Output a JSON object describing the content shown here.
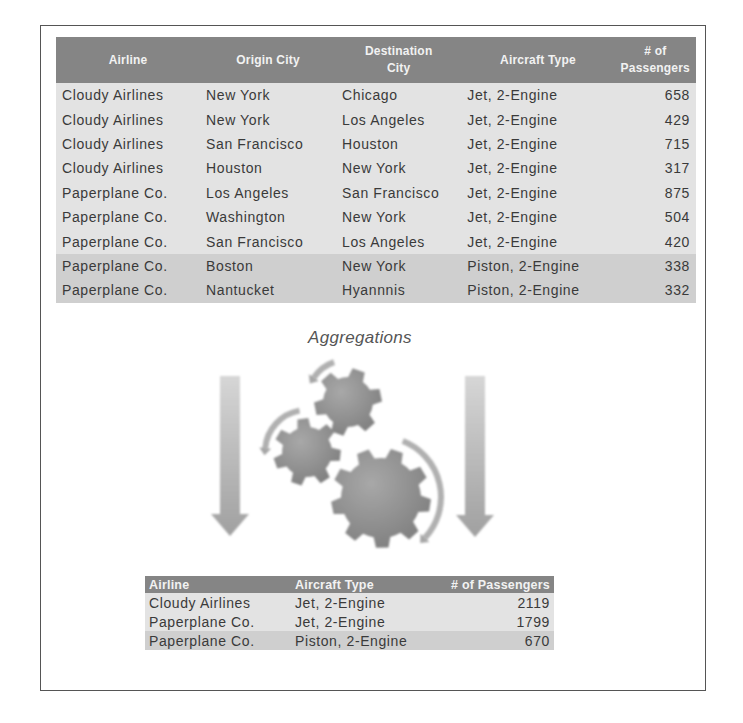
{
  "source_table": {
    "headers": [
      "Airline",
      "Origin City",
      "Destination City",
      "Aircraft Type",
      "# of Passengers"
    ],
    "header_lines": [
      [
        "Airline"
      ],
      [
        "Origin City"
      ],
      [
        "Destination",
        "City"
      ],
      [
        "Aircraft Type"
      ],
      [
        "# of",
        "Passengers"
      ]
    ],
    "rows": [
      {
        "airline": "Cloudy Airlines",
        "origin": "New York",
        "destination": "Chicago",
        "aircraft": "Jet, 2-Engine",
        "passengers": "658",
        "group": 1
      },
      {
        "airline": "Cloudy Airlines",
        "origin": "New York",
        "destination": "Los Angeles",
        "aircraft": "Jet, 2-Engine",
        "passengers": "429",
        "group": 1
      },
      {
        "airline": "Cloudy Airlines",
        "origin": "San Francisco",
        "destination": "Houston",
        "aircraft": "Jet, 2-Engine",
        "passengers": "715",
        "group": 1
      },
      {
        "airline": "Cloudy Airlines",
        "origin": "Houston",
        "destination": "New York",
        "aircraft": "Jet, 2-Engine",
        "passengers": "317",
        "group": 1
      },
      {
        "airline": "Paperplane Co.",
        "origin": "Los Angeles",
        "destination": "San Francisco",
        "aircraft": "Jet, 2-Engine",
        "passengers": "875",
        "group": 2
      },
      {
        "airline": "Paperplane Co.",
        "origin": "Washington",
        "destination": "New York",
        "aircraft": "Jet, 2-Engine",
        "passengers": "504",
        "group": 2
      },
      {
        "airline": "Paperplane Co.",
        "origin": "San Francisco",
        "destination": "Los Angeles",
        "aircraft": "Jet, 2-Engine",
        "passengers": "420",
        "group": 2
      },
      {
        "airline": "Paperplane Co.",
        "origin": "Boston",
        "destination": "New York",
        "aircraft": "Piston, 2-Engine",
        "passengers": "338",
        "group": 3
      },
      {
        "airline": "Paperplane Co.",
        "origin": "Nantucket",
        "destination": "Hyannnis",
        "aircraft": "Piston, 2-Engine",
        "passengers": "332",
        "group": 3
      }
    ]
  },
  "process": {
    "caption": "Aggregations",
    "icon": "gears-icon",
    "arrows": [
      "arrow-down-icon",
      "arrow-down-icon"
    ]
  },
  "aggregated_table": {
    "headers": [
      "Airline",
      "Aircraft Type",
      "# of Passengers"
    ],
    "rows": [
      {
        "airline": "Cloudy Airlines",
        "aircraft": "Jet, 2-Engine",
        "passengers": "2119"
      },
      {
        "airline": "Paperplane Co.",
        "aircraft": "Jet, 2-Engine",
        "passengers": "1799"
      },
      {
        "airline": "Paperplane Co.",
        "aircraft": "Piston, 2-Engine",
        "passengers": "670"
      }
    ]
  },
  "colors": {
    "header_bg": "#858585",
    "row_light": "#e3e3e3",
    "row_dark": "#cfcfcf",
    "gear": "#8f8f8f",
    "arrow": "#b5b5b5"
  }
}
